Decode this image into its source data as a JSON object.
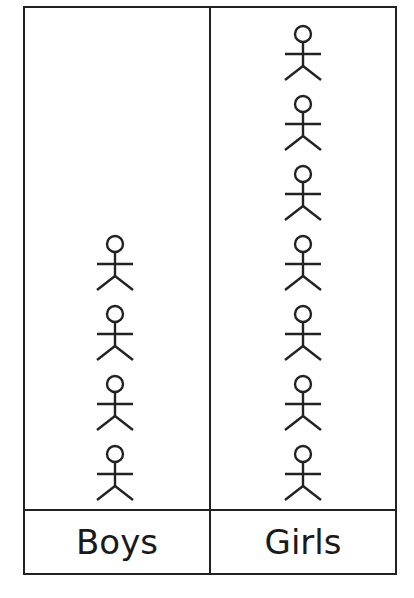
{
  "chart_data": {
    "type": "pictogram",
    "title": "",
    "categories": [
      "Boys",
      "Girls"
    ],
    "values": [
      4,
      7
    ],
    "icon": "stick-figure-icon",
    "xlabel": "",
    "ylabel": ""
  },
  "labels": {
    "boys": "Boys",
    "girls": "Girls"
  },
  "colors": {
    "line": "#222222",
    "background": "#ffffff"
  }
}
